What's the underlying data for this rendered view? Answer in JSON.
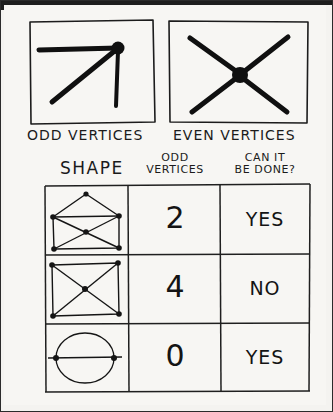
{
  "page": {
    "background_color": "#f4f3f0",
    "ink_color": "#141414"
  },
  "vertex_examples": [
    {
      "id": "odd",
      "label": "ODD VERTICES",
      "icon": "odd-vertex-diagram",
      "degree": 3,
      "description": "three edges meeting at a filled dot"
    },
    {
      "id": "even",
      "label": "EVEN VERTICES",
      "icon": "even-vertex-diagram",
      "degree": 4,
      "description": "four edges crossing at a filled dot"
    }
  ],
  "table": {
    "headers": {
      "shape": "SHAPE",
      "odd_vertices_line1": "ODD",
      "odd_vertices_line2": "VERTICES",
      "can_it_line1": "CAN IT",
      "can_it_line2": "BE DONE?"
    },
    "rows": [
      {
        "shape_name": "envelope-graph",
        "odd_vertices": "2",
        "can_it_be_done": "YES"
      },
      {
        "shape_name": "square-with-diagonals-graph",
        "odd_vertices": "4",
        "can_it_be_done": "NO"
      },
      {
        "shape_name": "lens-with-axis-graph",
        "odd_vertices": "0",
        "can_it_be_done": "YES"
      }
    ]
  }
}
